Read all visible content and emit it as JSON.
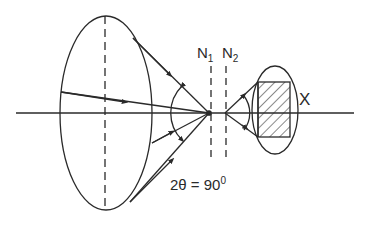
{
  "diagram": {
    "labels": {
      "n1": "N",
      "n1_sub": "1",
      "n2": "N",
      "n2_sub": "2",
      "x": "X",
      "angle_prefix": "2θ = 90",
      "angle_sup": "0"
    },
    "elements": [
      "large-lens-ellipse",
      "optical-axis",
      "focal-cone-rays",
      "dashed-plane-N1",
      "dashed-plane-N2",
      "small-ellipse-with-hatched-sample-X"
    ],
    "colors": {
      "stroke": "#2a2a2a",
      "background": "#ffffff"
    }
  }
}
